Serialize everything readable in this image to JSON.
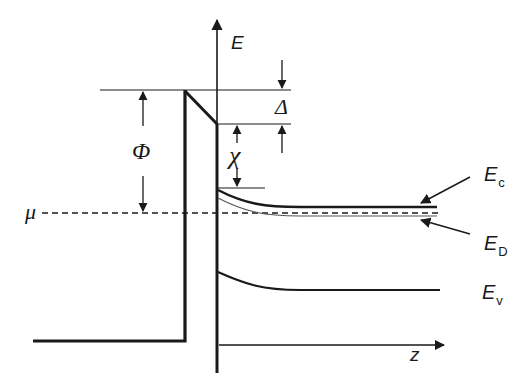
{
  "diagram": {
    "axes": {
      "y_label": "E",
      "x_label": "z"
    },
    "labels": {
      "work_function": "Φ",
      "barrier_offset": "Δ",
      "electron_affinity": "χ",
      "chemical_potential": "μ",
      "conduction_band": {
        "main": "E",
        "sub": "c"
      },
      "donor_level": {
        "main": "E",
        "sub": "D"
      },
      "valence_band": {
        "main": "E",
        "sub": "v"
      }
    },
    "colors": {
      "line": "#1a1a1a",
      "thin_line": "#555555",
      "background": "#ffffff"
    }
  }
}
